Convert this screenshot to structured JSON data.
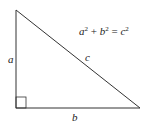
{
  "diagram": {
    "type": "right-triangle",
    "vertices": {
      "top": [
        16,
        10
      ],
      "right_angle": [
        16,
        108
      ],
      "right": [
        140,
        108
      ]
    },
    "right_angle_marker": true,
    "labels": {
      "vertical_leg": "a",
      "horizontal_leg": "b",
      "hypotenuse": "c"
    },
    "equation": {
      "a": "a",
      "a_exp": "2",
      "plus": "+",
      "b": "b",
      "b_exp": "2",
      "equals": "=",
      "c": "c",
      "c_exp": "2"
    },
    "colors": {
      "line": "#333333",
      "background": "#ffffff"
    }
  }
}
